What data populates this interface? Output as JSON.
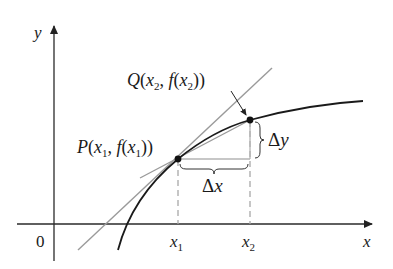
{
  "diagram": {
    "type": "secant-line-derivative",
    "axes": {
      "x_label": "x",
      "y_label": "y",
      "origin_label": "0"
    },
    "ticks": {
      "x1": {
        "base": "x",
        "sub": "1"
      },
      "x2": {
        "base": "x",
        "sub": "2"
      }
    },
    "points": {
      "P": {
        "name": "P",
        "x_base": "x",
        "x_sub": "1",
        "f": "f"
      },
      "Q": {
        "name": "Q",
        "x_base": "x",
        "x_sub": "2",
        "f": "f"
      }
    },
    "increments": {
      "dx": {
        "delta": "Δ",
        "var": "x"
      },
      "dy": {
        "delta": "Δ",
        "var": "y"
      }
    },
    "colors": {
      "axis": "#2a2a2a",
      "curve": "#1a1a1a",
      "line": "#9a9a9a",
      "dashed": "#a8a8a8",
      "point": "#111111"
    }
  }
}
